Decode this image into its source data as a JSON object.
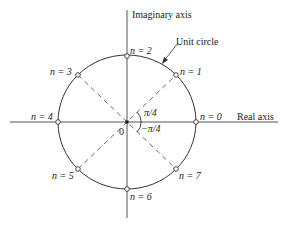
{
  "diagram": {
    "axes": {
      "real_label": "Real axis",
      "imag_label": "Imaginary axis",
      "origin_label": "0"
    },
    "circle_label": "Unit circle",
    "angles": {
      "positive": "π/4",
      "negative": "−π/4"
    },
    "points": [
      {
        "n": 0,
        "label": "n = 0"
      },
      {
        "n": 1,
        "label": "n = 1"
      },
      {
        "n": 2,
        "label": "n = 2"
      },
      {
        "n": 3,
        "label": "n = 3"
      },
      {
        "n": 4,
        "label": "n = 4"
      },
      {
        "n": 5,
        "label": "n = 5"
      },
      {
        "n": 6,
        "label": "n = 6"
      },
      {
        "n": 7,
        "label": "n = 7"
      }
    ],
    "colors": {
      "line": "#333333",
      "axis": "#555555",
      "marker_fill": "#ffffff"
    }
  }
}
